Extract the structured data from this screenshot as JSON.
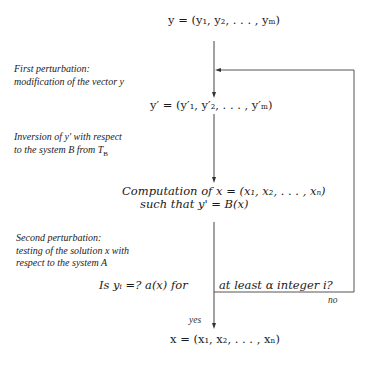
{
  "diagram": {
    "nodes": {
      "input_vector": "y = (y₁, y₂, . . . , yₘ)",
      "perturbed_vector": "y′ = (y′₁, y′₂, . . . , y′ₘ)",
      "computation_line1": "Computation of x = (x₁, x₂, . . . , xₙ)",
      "computation_line2": "such that y' = B(x)",
      "test_left": "Is yᵢ =? a(x) for",
      "test_right": "at least α integer i?",
      "output_vector": "x = (x₁, x₂, . . . , xₙ)"
    },
    "annotations": {
      "first_perturbation_line1": "First perturbation:",
      "first_perturbation_line2": "modification of the vector y",
      "inversion_line1": "Inversion of y' with respect",
      "inversion_line2": "to the system B from T",
      "inversion_subscript": "B",
      "second_perturbation_line1": "Second perturbation:",
      "second_perturbation_line2": "testing of the solution x with",
      "second_perturbation_line3": "respect to the system A"
    },
    "edge_labels": {
      "no": "no",
      "yes": "yes"
    },
    "colors": {
      "line": "#444444",
      "text": "#1a1a1a"
    }
  }
}
